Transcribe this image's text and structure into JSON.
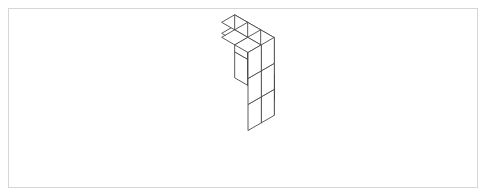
{
  "panel": {
    "name": "isometric-figure-panel",
    "border_color": "#d6d6d6",
    "background_color": "#ffffff",
    "x": 8,
    "y": 8,
    "width": 470,
    "height": 180
  },
  "figure": {
    "title": "",
    "type": "isometric-voxel-assembly",
    "line_color": "#4a4a4a",
    "face_color": "#ffffff",
    "line_width": 0.9,
    "projection": {
      "mode": "isometric",
      "unit_half_width": 26,
      "unit_half_depth": 15,
      "unit_height": 26,
      "origin_x": 235,
      "origin_y": 78
    },
    "cube_count": 18,
    "cubes": [
      {
        "x": 0,
        "y": 0,
        "z": 0
      },
      {
        "x": 0,
        "y": 0,
        "z": 1
      },
      {
        "x": 1,
        "y": 0,
        "z": 0
      },
      {
        "x": 2,
        "y": 0,
        "z": 0
      },
      {
        "x": 1,
        "y": 0,
        "z": 1
      },
      {
        "x": 1,
        "y": 1,
        "z": 1
      },
      {
        "x": 1,
        "y": 1,
        "z": 2
      },
      {
        "x": 2,
        "y": 1,
        "z": 0
      },
      {
        "x": 2,
        "y": 1,
        "z": 1
      },
      {
        "x": 2,
        "y": 1,
        "z": 2
      },
      {
        "x": 2,
        "y": 2,
        "z": 2
      },
      {
        "x": 3,
        "y": 1,
        "z": 0
      },
      {
        "x": 3,
        "y": 1,
        "z": 1
      },
      {
        "x": 3,
        "y": 1,
        "z": 2
      },
      {
        "x": 3,
        "y": 2,
        "z": 0
      },
      {
        "x": 3,
        "y": 2,
        "z": 1
      },
      {
        "x": 3,
        "y": 2,
        "z": 2
      },
      {
        "x": 2,
        "y": 2,
        "z": 1
      }
    ]
  }
}
